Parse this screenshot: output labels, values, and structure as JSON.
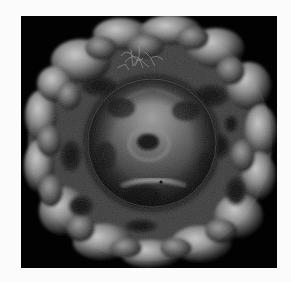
{
  "figure": {
    "type": "3D surface rendering",
    "background_color": "#020202",
    "page_color": "#fbfbfb",
    "colormap": "grayscale",
    "components": [
      {
        "name": "outer-shell",
        "description": "bumpy porous outer protein shell"
      },
      {
        "name": "inner-core",
        "description": "smooth inner capsid sphere with central dimple"
      },
      {
        "name": "filaments",
        "description": "thin fibrous strands near the top"
      }
    ],
    "text": []
  }
}
